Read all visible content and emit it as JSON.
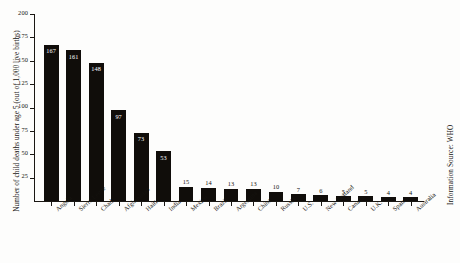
{
  "chart_data": {
    "type": "bar",
    "title": "",
    "subtitle": "",
    "xlabel": "",
    "ylabel": "Number of child deaths under age 5 (out of 1,000 live births)",
    "ylim": [
      0,
      200
    ],
    "ytick_labels": [
      "25",
      "50",
      "75",
      "100",
      "125",
      "150",
      "175",
      "200"
    ],
    "ytick_values": [
      25,
      50,
      75,
      100,
      125,
      150,
      175,
      200
    ],
    "grid": false,
    "legend": null,
    "bar_color": "#100d0a",
    "categories": [
      "Angola",
      "Sierra Leone",
      "Chad",
      "Afghanistan",
      "Haiti",
      "India",
      "Mexico",
      "Brazil",
      "Argentina",
      "China",
      "Russia",
      "U.S.",
      "New Zealand",
      "Canada",
      "U.K.",
      "Spain",
      "Australia"
    ],
    "values": [
      167,
      161,
      148,
      97,
      73,
      53,
      15,
      14,
      13,
      13,
      10,
      7,
      6,
      5,
      5,
      4,
      4
    ],
    "value_labels": [
      "167",
      "161",
      "148",
      "97",
      "73",
      "53",
      "15",
      "14",
      "13",
      "13",
      "10",
      "7",
      "6",
      "5",
      "5",
      "4",
      "4"
    ]
  },
  "annotations": {
    "source_note": "Information Source: WHO"
  }
}
